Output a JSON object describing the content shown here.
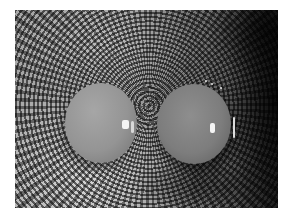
{
  "image": {
    "description": "Grayscale photograph of two eggs resting in a bowl with a concentric ring and radial line pattern",
    "subjects": [
      {
        "name": "left-egg",
        "tone": "light gray",
        "highlight": "specular highlight on right side"
      },
      {
        "name": "right-egg",
        "tone": "medium gray",
        "highlight": "specular highlight and rim reflection on right side"
      }
    ],
    "background": {
      "pattern": "concentric rings with radial spokes (checkered look)",
      "center_hint": "between the eggs, slightly above middle",
      "lighting": "lighter toward lower-left, dark toward right edge"
    },
    "colors": {
      "margin": "#ffffff",
      "light_pattern": "#a8a8a8",
      "dark_edge": "#2a2a2a",
      "left_egg": "#949494",
      "right_egg": "#7d7d7d",
      "highlight": "#f4f4f4"
    }
  }
}
